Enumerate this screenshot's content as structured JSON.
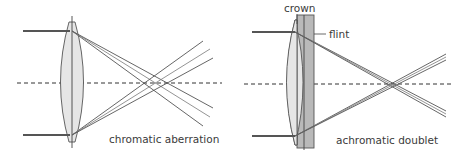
{
  "diagrams": [
    {
      "id": "left",
      "caption": "chromatic aberration",
      "lens": "single-convex-lens",
      "colors": {
        "ray": "#555555",
        "lens_fill": "#e6e6e6",
        "lens_stroke": "#555555",
        "axis": "#333333"
      }
    },
    {
      "id": "right",
      "caption": "achromatic doublet",
      "labels": {
        "crown": "crown",
        "flint": "flint"
      },
      "colors": {
        "ray": "#555555",
        "crown_fill": "#e6e6e6",
        "flint_fill": "#b9b9b9",
        "lens_stroke": "#555555",
        "axis": "#333333"
      }
    }
  ]
}
